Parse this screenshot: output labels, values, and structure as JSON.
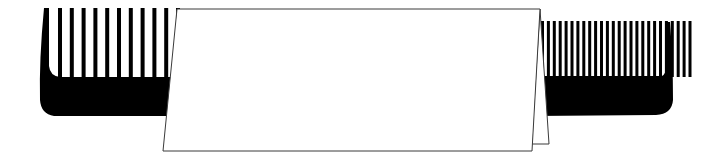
{
  "scene": {
    "description": "Two black combs partially covered by a blank white folded card",
    "background": "#ffffff",
    "ink_color": "#000000",
    "paper_color": "#ffffff",
    "paper_stroke": "#3a3a3a"
  },
  "left_comb": {
    "teeth_count": 11,
    "teeth_x_start": 58,
    "teeth_spacing": 11.8,
    "teeth_width": 4,
    "teeth_top": 8,
    "spine_top": 77,
    "spine_bottom": 116
  },
  "right_comb": {
    "teeth_count": 26,
    "teeth_x_start": 541,
    "teeth_spacing": 5.9,
    "teeth_width": 3,
    "teeth_top": 21,
    "spine_top": 76,
    "spine_bottom": 116
  },
  "card": {
    "label": ""
  }
}
